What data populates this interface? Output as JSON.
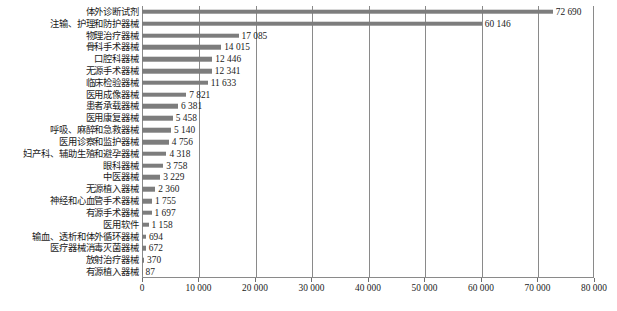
{
  "chart_data": {
    "type": "bar",
    "orientation": "horizontal",
    "title": "",
    "xlabel": "",
    "ylabel": "",
    "xlim": [
      0,
      80000
    ],
    "xticks": [
      0,
      10000,
      20000,
      30000,
      40000,
      50000,
      60000,
      70000,
      80000
    ],
    "xtick_labels": [
      "0",
      "10 000",
      "20 000",
      "30 000",
      "40 000",
      "50 000",
      "60 000",
      "70 000",
      "80 000"
    ],
    "grid": true,
    "legend": "none",
    "bar_color": "#7d7d7d",
    "axis_color": "#8a8a8a",
    "categories": [
      "体外诊断试剂",
      "注输、护理和防护器械",
      "物理治疗器械",
      "骨科手术器械",
      "口腔科器械",
      "无源手术器械",
      "临床检验器械",
      "医用成像器械",
      "患者承载器械",
      "医用康复器械",
      "呼吸、麻醉和急救器械",
      "医用诊察和监护器械",
      "妇产科、辅助生殖和避孕器械",
      "眼科器械",
      "中医器械",
      "无源植入器械",
      "神经和心血管手术器械",
      "有源手术器械",
      "医用软件",
      "输血、透析和体外循环器械",
      "医疗器械消毒灭菌器械",
      "放射治疗器械",
      "有源植入器械"
    ],
    "values": [
      72690,
      60146,
      17085,
      14015,
      12446,
      12341,
      11633,
      7821,
      6381,
      5458,
      5140,
      4756,
      4318,
      3758,
      3229,
      2360,
      1755,
      1697,
      1158,
      694,
      672,
      370,
      87
    ],
    "value_labels": [
      "72 690",
      "60 146",
      "17 085",
      "14 015",
      "12 446",
      "12 341",
      "11 633",
      "7 821",
      "6 381",
      "5 458",
      "5 140",
      "4 756",
      "4 318",
      "3 758",
      "3 229",
      "2 360",
      "1 755",
      "1 697",
      "1 158",
      "694",
      "672",
      "370",
      "87"
    ]
  },
  "caption": ""
}
